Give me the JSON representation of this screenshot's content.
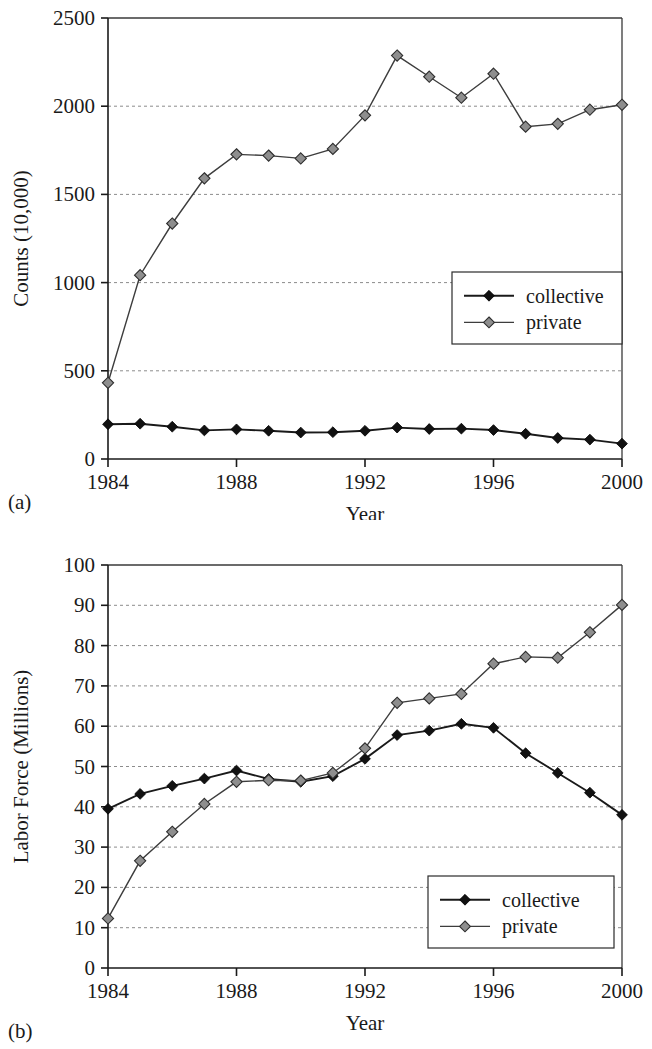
{
  "figures": [
    {
      "panel_label": "(a)",
      "chart_ref": 0
    },
    {
      "panel_label": "(b)",
      "chart_ref": 1
    }
  ],
  "legend": {
    "collective_label": "collective",
    "private_label": "private",
    "collective_marker": "filled-diamond-black",
    "private_marker": "filled-diamond-gray"
  },
  "colors": {
    "collective": "#111111",
    "private": "#8e8e8e",
    "axis": "#1a1a1a",
    "grid": "#8c8c8c",
    "background": "#ffffff"
  },
  "chart_data": [
    {
      "type": "line",
      "title": "",
      "xlabel": "Year",
      "ylabel": "Counts (10,000)",
      "x": [
        1984,
        1985,
        1986,
        1987,
        1988,
        1989,
        1990,
        1991,
        1992,
        1993,
        1994,
        1995,
        1996,
        1997,
        1998,
        1999,
        2000
      ],
      "xlim": [
        1984,
        2000
      ],
      "ylim": [
        0,
        2500
      ],
      "xticks": [
        1984,
        1988,
        1992,
        1996,
        2000
      ],
      "xtick_labels": [
        "1984",
        "1988",
        "1992",
        "1996",
        "2000"
      ],
      "yticks": [
        0,
        500,
        1000,
        1500,
        2000,
        2500
      ],
      "ytick_labels": [
        "0",
        "500",
        "1000",
        "1500",
        "2000",
        "2500"
      ],
      "grid": "horizontal-dashed",
      "legend_position": "right-middle",
      "series": [
        {
          "name": "collective",
          "marker": "filled-diamond-black",
          "values": [
            197,
            200,
            183,
            162,
            168,
            160,
            150,
            152,
            160,
            178,
            170,
            172,
            164,
            143,
            119,
            110,
            87
          ]
        },
        {
          "name": "private",
          "marker": "filled-diamond-gray",
          "values": [
            432,
            1042,
            1335,
            1591,
            1727,
            1720,
            1704,
            1758,
            1948,
            2287,
            2167,
            2048,
            2184,
            1884,
            1900,
            1980,
            2008
          ]
        }
      ]
    },
    {
      "type": "line",
      "title": "",
      "xlabel": "Year",
      "ylabel": "Labor Force (Millions)",
      "x": [
        1984,
        1985,
        1986,
        1987,
        1988,
        1989,
        1990,
        1991,
        1992,
        1993,
        1994,
        1995,
        1996,
        1997,
        1998,
        1999,
        2000
      ],
      "xlim": [
        1984,
        2000
      ],
      "ylim": [
        0,
        100
      ],
      "xticks": [
        1984,
        1988,
        1992,
        1996,
        2000
      ],
      "xtick_labels": [
        "1984",
        "1988",
        "1992",
        "1996",
        "2000"
      ],
      "yticks": [
        0,
        10,
        20,
        30,
        40,
        50,
        60,
        70,
        80,
        90,
        100
      ],
      "ytick_labels": [
        "0",
        "10",
        "20",
        "30",
        "40",
        "50",
        "60",
        "70",
        "80",
        "90",
        "100"
      ],
      "grid": "horizontal-dashed",
      "legend_position": "right-bottom",
      "series": [
        {
          "name": "collective",
          "marker": "filled-diamond-black",
          "values": [
            39.5,
            43.2,
            45.2,
            47.0,
            49.0,
            46.9,
            46.2,
            47.6,
            51.9,
            57.8,
            58.9,
            60.6,
            59.6,
            53.3,
            48.4,
            43.5,
            38.0
          ]
        },
        {
          "name": "private",
          "marker": "filled-diamond-gray",
          "values": [
            12.3,
            26.6,
            33.8,
            40.7,
            46.2,
            46.6,
            46.5,
            48.4,
            54.5,
            65.8,
            66.9,
            68.0,
            75.5,
            77.2,
            77.0,
            83.3,
            90.1
          ]
        }
      ]
    }
  ]
}
